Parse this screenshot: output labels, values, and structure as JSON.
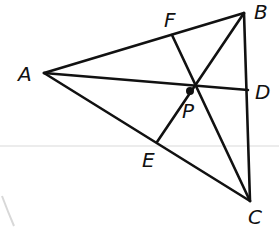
{
  "figure": {
    "type": "triangle-with-concurrent-cevians",
    "vertices": [
      "A",
      "B",
      "C"
    ],
    "concurrency_point": "P",
    "feet": {
      "F": "AB",
      "D": "BC",
      "E": "AC"
    },
    "segments": [
      {
        "from": "A",
        "to": "B"
      },
      {
        "from": "B",
        "to": "C"
      },
      {
        "from": "A",
        "to": "C"
      },
      {
        "from": "A",
        "to": "D"
      },
      {
        "from": "B",
        "to": "E"
      },
      {
        "from": "C",
        "to": "F"
      }
    ]
  },
  "labels": {
    "A": "A",
    "B": "B",
    "C": "C",
    "D": "D",
    "E": "E",
    "F": "F",
    "P": "P"
  },
  "colors": {
    "stroke": "#111111",
    "background": "#ffffff"
  }
}
